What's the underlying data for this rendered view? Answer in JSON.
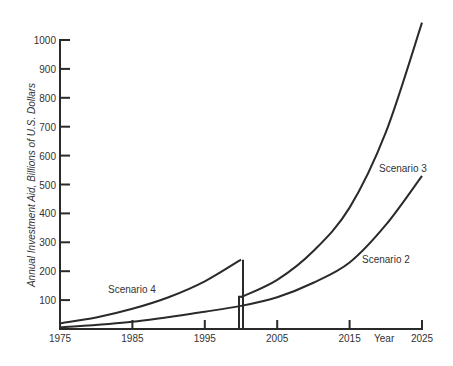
{
  "chart_data": {
    "type": "line",
    "title": "",
    "xlabel": "Year",
    "ylabel": "Annual Investment Aid, Billions of U.S. Dollars",
    "xlim": [
      1975,
      2025
    ],
    "ylim": [
      0,
      1000
    ],
    "x_ticks": [
      "1975",
      "1985",
      "1995",
      "2005",
      "2015",
      "2025"
    ],
    "y_ticks": [
      "100",
      "200",
      "300",
      "400",
      "500",
      "600",
      "700",
      "800",
      "900",
      "1000"
    ],
    "grid": false,
    "legend": "inline labels",
    "series": [
      {
        "name": "Scenario 4",
        "x": [
          1975,
          1980,
          1985,
          1990,
          1995,
          2000
        ],
        "values": [
          20,
          40,
          70,
          110,
          165,
          240
        ]
      },
      {
        "name": "Scenario 3",
        "x": [
          2000,
          2005,
          2010,
          2015,
          2020,
          2025
        ],
        "values": [
          110,
          170,
          270,
          420,
          680,
          1060
        ]
      },
      {
        "name": "Scenario 2",
        "x": [
          1975,
          1985,
          1995,
          2000,
          2005,
          2010,
          2015,
          2020,
          2025
        ],
        "values": [
          5,
          25,
          60,
          80,
          110,
          160,
          230,
          360,
          530
        ]
      }
    ],
    "annotations": [
      "Scenario 4",
      "Scenario 3",
      "Scenario 2",
      "Year"
    ]
  },
  "labels": {
    "scenario4": "Scenario 4",
    "scenario3": "Scenario 3",
    "scenario2": "Scenario 2",
    "year": "Year",
    "ylabel": "Annual Investment Aid, Billions of U.S. Dollars"
  }
}
